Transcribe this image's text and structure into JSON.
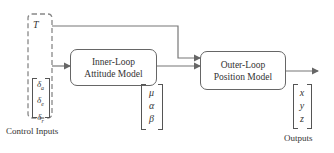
{
  "diagram": {
    "inputs": {
      "thrust": "T",
      "control_surfaces": [
        "δ",
        "δ",
        "δ"
      ],
      "control_surface_subscripts": [
        "a",
        "e",
        "r"
      ],
      "label": "Control Inputs"
    },
    "blocks": {
      "inner_loop": {
        "line1": "Inner-Loop",
        "line2": "Attitude Model"
      },
      "outer_loop": {
        "line1": "Outer-Loop",
        "line2": "Position Model"
      }
    },
    "intermediate": [
      "μ",
      "α",
      "β"
    ],
    "outputs": {
      "vector": [
        "x",
        "y",
        "z"
      ],
      "label": "Outputs"
    },
    "colors": {
      "line": "#666666",
      "dashed": "#888888"
    }
  }
}
